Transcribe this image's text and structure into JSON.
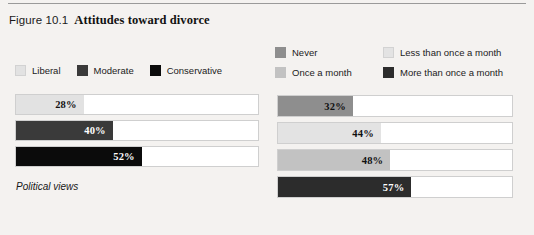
{
  "figure": {
    "number": "Figure 10.1",
    "title": "Attitudes toward divorce"
  },
  "chart_data": [
    {
      "type": "bar",
      "title": "Political views",
      "xlabel": "",
      "ylabel": "",
      "xlim": [
        0,
        100
      ],
      "grid": false,
      "orientation": "horizontal",
      "legend_position": "top",
      "categories": [
        "Liberal",
        "Moderate",
        "Conservative"
      ],
      "values": [
        28,
        40,
        52
      ],
      "value_labels": [
        "28%",
        "40%",
        "52%"
      ],
      "colors": [
        "#e2e2e2",
        "#3a3a3a",
        "#0b0b0b"
      ],
      "label_colors": [
        "#111111",
        "#ffffff",
        "#ffffff"
      ],
      "legend": [
        {
          "label": "Liberal",
          "color": "#e2e2e2"
        },
        {
          "label": "Moderate",
          "color": "#3a3a3a"
        },
        {
          "label": "Conservative",
          "color": "#0b0b0b"
        }
      ]
    },
    {
      "type": "bar",
      "title": "Religious activities",
      "xlabel": "",
      "ylabel": "",
      "xlim": [
        0,
        100
      ],
      "grid": false,
      "orientation": "horizontal",
      "legend_position": "top",
      "categories": [
        "Never",
        "Less than once a month",
        "Once a month",
        "More than once a month"
      ],
      "values": [
        32,
        44,
        48,
        57
      ],
      "value_labels": [
        "32%",
        "44%",
        "48%",
        "57%"
      ],
      "colors": [
        "#8e8e8e",
        "#e3e3e3",
        "#c2c2c2",
        "#2c2c2c"
      ],
      "label_colors": [
        "#111111",
        "#111111",
        "#111111",
        "#ffffff"
      ],
      "legend": [
        {
          "label": "Never",
          "color": "#8e8e8e"
        },
        {
          "label": "Less than once a month",
          "color": "#e3e3e3"
        },
        {
          "label": "Once a month",
          "color": "#c2c2c2"
        },
        {
          "label": "More than once a month",
          "color": "#2c2c2c"
        }
      ]
    }
  ],
  "left_panel": {
    "legend": [
      {
        "label": "Liberal",
        "color": "#e2e2e2"
      },
      {
        "label": "Moderate",
        "color": "#3a3a3a"
      },
      {
        "label": "Conservative",
        "color": "#0b0b0b"
      }
    ],
    "bars": [
      {
        "label": "28%",
        "value": 28,
        "color": "#e2e2e2",
        "text_color": "#111111"
      },
      {
        "label": "40%",
        "value": 40,
        "color": "#3a3a3a",
        "text_color": "#ffffff"
      },
      {
        "label": "52%",
        "value": 52,
        "color": "#0b0b0b",
        "text_color": "#ffffff"
      }
    ],
    "caption": "Political views"
  },
  "right_panel": {
    "legend": [
      {
        "label": "Never",
        "color": "#8e8e8e"
      },
      {
        "label": "Less than once a month",
        "color": "#e3e3e3"
      },
      {
        "label": "Once a month",
        "color": "#c2c2c2"
      },
      {
        "label": "More than once a month",
        "color": "#2c2c2c"
      }
    ],
    "bars": [
      {
        "label": "32%",
        "value": 32,
        "color": "#8e8e8e",
        "text_color": "#111111"
      },
      {
        "label": "44%",
        "value": 44,
        "color": "#e3e3e3",
        "text_color": "#111111"
      },
      {
        "label": "48%",
        "value": 48,
        "color": "#c2c2c2",
        "text_color": "#111111"
      },
      {
        "label": "57%",
        "value": 57,
        "color": "#2c2c2c",
        "text_color": "#ffffff"
      }
    ],
    "caption": "Religious activities"
  }
}
